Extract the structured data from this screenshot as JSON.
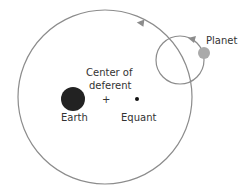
{
  "diagram": {
    "labels": {
      "planet": "Planet",
      "center_line1": "Center of",
      "center_line2": "deferent",
      "center_mark": "+",
      "earth": "Earth",
      "equant": "Equant"
    },
    "colors": {
      "orbit_stroke": "#8c8c8c",
      "earth_fill": "#222222",
      "planet_fill": "#aaaaaa",
      "equant_fill": "#111111",
      "text": "#333333"
    },
    "icons": {
      "deferent_arrow": "arrow-left-on-orbit",
      "epicycle_arrow": "arrow-left-on-orbit"
    }
  }
}
